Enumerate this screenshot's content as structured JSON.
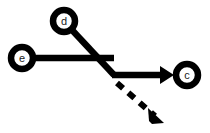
{
  "diagram": {
    "background_color": "#ffffff",
    "stroke_color": "#000000",
    "label_color": "#1a1a1a",
    "nodes": [
      {
        "id": "d",
        "label": "d",
        "cx": 64,
        "cy": 21,
        "r": 11
      },
      {
        "id": "e",
        "label": "e",
        "cx": 22,
        "cy": 58,
        "r": 11
      },
      {
        "id": "c",
        "label": "c",
        "cx": 187,
        "cy": 75,
        "r": 11
      }
    ],
    "junction": {
      "x": 114,
      "y": 75
    },
    "edges": [
      {
        "id": "edge-d-junction",
        "from": "d",
        "to": "junction",
        "style": "solid",
        "arrow": "none",
        "path": "M 72,30 L 114,75"
      },
      {
        "id": "edge-e-junction",
        "from": "e",
        "to": "junction",
        "style": "solid",
        "arrow": "none",
        "path": "M 33,58 L 114,58"
      },
      {
        "id": "edge-junction-c",
        "from": "junction",
        "to": "c",
        "style": "solid",
        "arrow": "filled-triangle",
        "path": "M 112,75 L 163,75"
      },
      {
        "id": "edge-junction-dashed",
        "from": "junction",
        "to": "unlabeled-target",
        "style": "dashed",
        "arrow": "filled-triangle",
        "path": "M 117,83 L 155,116"
      }
    ]
  }
}
